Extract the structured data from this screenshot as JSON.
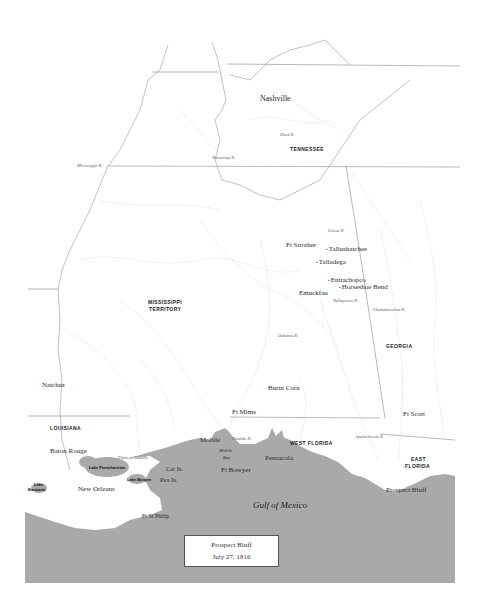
{
  "map": {
    "colors": {
      "background": "#ffffff",
      "water": "#a9a9a9",
      "border": "#888888",
      "river": "#c8c8c8",
      "caption_border": "#555555"
    },
    "caption": {
      "line1": "Prospect Bluff",
      "line2": "July 27, 1816"
    },
    "regions": {
      "tennessee": "Tennessee",
      "mississippi_territory_1": "Mississippi",
      "mississippi_territory_2": "Territory",
      "georgia": "Georgia",
      "louisiana": "Louisiana",
      "west_florida": "West Florida",
      "east_florida_1": "East",
      "east_florida_2": "Florida"
    },
    "places": {
      "nashville": "Nashville",
      "ft_strother": "Ft Strother",
      "tallushatchee": "Tallushatchee",
      "talladega": "Talladega",
      "emuckfau": "Emuckfau",
      "enitachopco": "Enitachopco",
      "horseshoe_bend": "Horseshoe Bend",
      "burnt_corn": "Burnt Corn",
      "ft_mims": "Ft Mims",
      "natchez": "Natchez",
      "baton_rouge": "Baton Rouge",
      "mobile": "Mobile",
      "pensacola": "Pensacola",
      "ft_bowyer": "Ft Bowyer",
      "new_orleans": "New Orleans",
      "ft_st_philip": "Ft St Philip",
      "ft_scott": "Ft Scott",
      "prospect_bluff": "Prospect Bluff"
    },
    "rivers": {
      "duck": "Duck R.",
      "tennessee": "Tennessee R.",
      "mississippi": "Mississippi R.",
      "coosa": "Coosa R.",
      "tallapoosa": "Tallapoosa R.",
      "chattahoochee": "Chattahoochee R.",
      "alabama": "Alabama R.",
      "perdido": "Perdido R.",
      "apalachicola": "Apalachicola R."
    },
    "waters": {
      "gulf": "Gulf of Mexico",
      "lake_pontchartrain": "Lake Pontchartrain",
      "lake_borgne": "Lake Borgne",
      "lake_barataria_1": "Lake",
      "lake_barataria_2": "Barataria",
      "mobile_bay_1": "Mobile",
      "mobile_bay_2": "Bay",
      "pass_christian": "Plain of Gentilly"
    },
    "islands": {
      "cat": "Cat Is.",
      "pea": "Pea Is."
    }
  }
}
